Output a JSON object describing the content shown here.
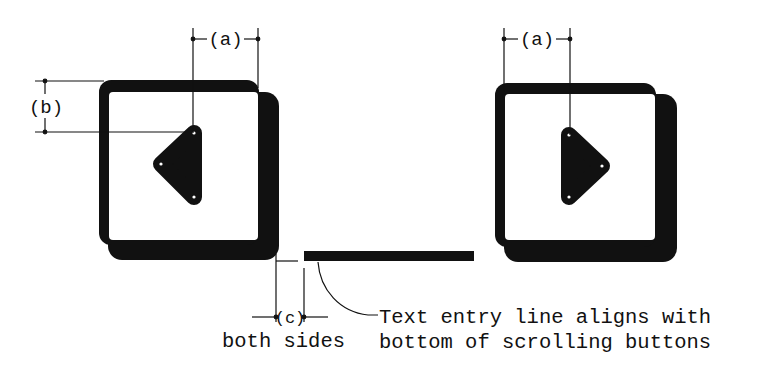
{
  "diagram": {
    "colors": {
      "ink": "#111111",
      "background": "#ffffff",
      "inner": "#ffffff"
    },
    "left_button": {
      "name": "scroll-left-button",
      "arrow": "left-triangle-icon"
    },
    "right_button": {
      "name": "scroll-right-button",
      "arrow": "right-triangle-icon"
    },
    "dimensions": {
      "a_left": "(a)",
      "a_right": "(a)",
      "b": "(b)",
      "c": "(c)",
      "c_note": "both sides"
    },
    "text_entry_line": {
      "name": "text-entry-line"
    },
    "callout": {
      "line1": "Text entry line aligns with",
      "line2": "bottom of scrolling buttons"
    }
  }
}
